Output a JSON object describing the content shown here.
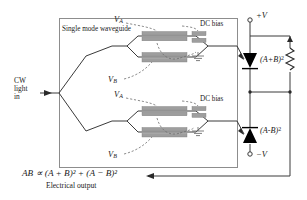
{
  "figure": {
    "type": "optical-modulator-balanced-detector-schematic",
    "chip_label": "Single mode waveguide",
    "input_label_lines": [
      "CW",
      "light",
      "in"
    ],
    "output_equation": "AB ∝ (A + B)² + (A − B)²",
    "output_caption": "Electrical output"
  },
  "modulators": [
    {
      "id": "upper",
      "drive_top": "V",
      "drive_top_sub": "A",
      "drive_bottom": "V",
      "drive_bottom_sub": "B",
      "dc_bias_label": "DC bias",
      "ground_symbol": "ground-icon"
    },
    {
      "id": "lower",
      "drive_top": "V",
      "drive_top_sub": "A",
      "drive_bottom": "V",
      "drive_bottom_sub": "B",
      "dc_bias_label": "DC bias",
      "ground_symbol": "ground-icon"
    }
  ],
  "detectors": [
    {
      "id": "upper-photodiode",
      "signal_base": "(A+B)",
      "signal_exp": "2",
      "supply_label": "+V",
      "supply_polarity": "positive"
    },
    {
      "id": "lower-photodiode",
      "signal_base": "(A-B)",
      "signal_exp": "2",
      "supply_label": "−V",
      "supply_polarity": "negative"
    }
  ],
  "components": {
    "resistor_label": "resistor-icon",
    "output_arrow": "output-arrow-icon",
    "input_arrow": "input-arrow-icon"
  },
  "colors": {
    "line": "#3a3a3a",
    "chip_border": "#7a7a7a",
    "electrode": "#9a9a9a",
    "electrode_dark": "#8a8a8a",
    "dashed": "#6f6f6f",
    "background": "#ffffff",
    "diode": "#000000"
  }
}
